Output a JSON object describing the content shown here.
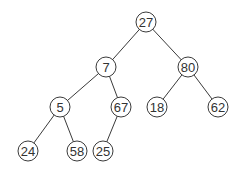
{
  "diagram": {
    "type": "binary-tree",
    "colors": {
      "background": "#ffffff",
      "stroke": "#3a3a3a",
      "text": "#333333"
    },
    "nodes": [
      {
        "id": "n27",
        "label": "27",
        "x": 146,
        "y": 22
      },
      {
        "id": "n7",
        "label": "7",
        "x": 106,
        "y": 67
      },
      {
        "id": "n80",
        "label": "80",
        "x": 188,
        "y": 67
      },
      {
        "id": "n5",
        "label": "5",
        "x": 60,
        "y": 107
      },
      {
        "id": "n67",
        "label": "67",
        "x": 121,
        "y": 107
      },
      {
        "id": "n18",
        "label": "18",
        "x": 157,
        "y": 107
      },
      {
        "id": "n62",
        "label": "62",
        "x": 218,
        "y": 107
      },
      {
        "id": "n24",
        "label": "24",
        "x": 28,
        "y": 151
      },
      {
        "id": "n58",
        "label": "58",
        "x": 77,
        "y": 151
      },
      {
        "id": "n25",
        "label": "25",
        "x": 103,
        "y": 151
      }
    ],
    "edges": [
      [
        "n27",
        "n7"
      ],
      [
        "n27",
        "n80"
      ],
      [
        "n7",
        "n5"
      ],
      [
        "n7",
        "n67"
      ],
      [
        "n80",
        "n18"
      ],
      [
        "n80",
        "n62"
      ],
      [
        "n5",
        "n24"
      ],
      [
        "n5",
        "n58"
      ],
      [
        "n67",
        "n25"
      ]
    ],
    "node_radius": 10
  }
}
